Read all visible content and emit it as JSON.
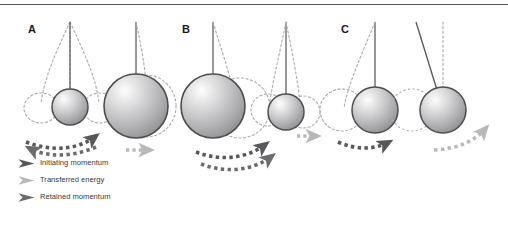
{
  "figure": {
    "background": "#ffffff",
    "top_rule_color": "#58585a",
    "panels": [
      {
        "id": "A",
        "label": "A",
        "description": "small ball strikes large stationary ball",
        "balls": [
          {
            "name": "small-ball-left",
            "cx": 70,
            "cy": 107,
            "r": 18,
            "size": "small"
          },
          {
            "name": "large-ball-right",
            "cx": 136,
            "cy": 106,
            "r": 32,
            "size": "large"
          }
        ]
      },
      {
        "id": "B",
        "label": "B",
        "description": "large ball strikes small stationary ball",
        "balls": [
          {
            "name": "large-ball-left",
            "cx": 213,
            "cy": 106,
            "r": 32,
            "size": "large"
          },
          {
            "name": "small-ball-right",
            "cx": 286,
            "cy": 112,
            "r": 18,
            "size": "small"
          }
        ]
      },
      {
        "id": "C",
        "label": "C",
        "description": "equal mass balls, full transfer of momentum",
        "balls": [
          {
            "name": "ball-left",
            "cx": 375,
            "cy": 110,
            "r": 23,
            "size": "medium"
          },
          {
            "name": "ball-right",
            "cx": 443,
            "cy": 110,
            "r": 23,
            "size": "medium"
          }
        ]
      }
    ]
  },
  "colors": {
    "initiating_momentum": "#58585a",
    "transferred_energy": "#b9b9bb",
    "retained_momentum": "#6b6b6d",
    "ball_outline": "#4e4e50",
    "ball_highlight": "#f2f2f2",
    "ball_mid": "#c9c9cb",
    "ball_shadow": "#8f8f91",
    "string": "#5a5a5c",
    "ghost_dash": "#aeaeb0",
    "label_text": "#1a1a1a",
    "legend_text": "#3a3a3a"
  },
  "legend": {
    "items": [
      {
        "name": "legend-initiating-momentum",
        "label": "Initiating momentum",
        "arrow_color": "#58585a"
      },
      {
        "name": "legend-transferred-energy",
        "label": "Transferred energy",
        "arrow_color": "#b9b9bb"
      },
      {
        "name": "legend-retained-momentum",
        "label": "Retained momentum",
        "arrow_color": "#6b6b6d"
      }
    ]
  }
}
